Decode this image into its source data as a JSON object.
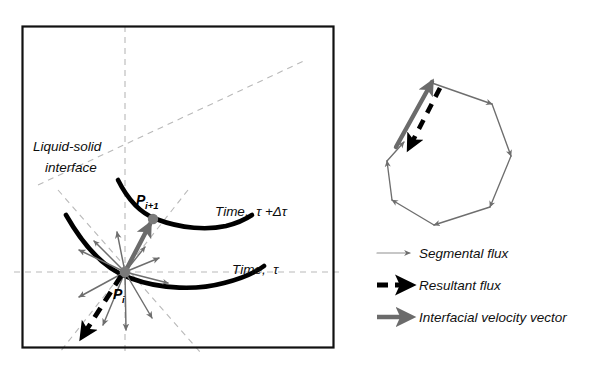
{
  "figure": {
    "kind": "schematic-diagram",
    "background": "#ffffff",
    "panels": [
      "interface-panel",
      "polygon-panel",
      "legend-panel"
    ]
  },
  "colors": {
    "curve": "#000000",
    "box_border": "#111111",
    "guide_dash": "#b9b9b9",
    "segmental_arrow": "#6e6e6e",
    "velocity_arrow": "#6b6b6b",
    "resultant_arrow": "#000000",
    "node_dot": "#7a7a7a",
    "text": "#0d0d0d"
  },
  "left_panel": {
    "name": "liquid-solid-interface-panel",
    "box": {
      "x": 22,
      "y": 26,
      "width": 311,
      "height": 321
    },
    "annotations": {
      "interface_label_line1": "Liquid-solid",
      "interface_label_line2": "interface",
      "time_upper": "Time,  τ +Δτ",
      "time_lower": "Time,  τ",
      "point_i": "P",
      "point_i_sub": "i",
      "point_i_plus_1": "P",
      "point_i_plus_1_sub": "i+1"
    },
    "guides": {
      "vertical_dashed_x": 125,
      "horizontal_dashed_y": 272,
      "diagonal_count": 2
    },
    "nodes": [
      {
        "id": "Pi",
        "x": 125,
        "y": 272
      },
      {
        "id": "Pi+1",
        "x": 153,
        "y": 218
      }
    ],
    "segmental_flux_arrow_count": 10,
    "velocity_vector": {
      "from": "Pi",
      "to": "Pi+1"
    },
    "resultant_flux": {
      "from": "Pi",
      "direction": "down-left"
    }
  },
  "right_panel": {
    "name": "polygon-flux-panel",
    "shape": "heptagon",
    "vertex_count": 7,
    "edge_arrow_count": 7,
    "highlighted_edge": "upper-left",
    "highlighted_edge_overlays": [
      "interfacial-velocity-vector",
      "resultant-flux"
    ]
  },
  "legend": {
    "name": "flux-legend",
    "items": [
      {
        "id": "segmental-flux",
        "label": "Segmental flux",
        "style": "thin-gray-arrow",
        "color": "#6e6e6e"
      },
      {
        "id": "resultant-flux",
        "label": "Resultant flux",
        "style": "thick-black-dashed-arrow",
        "color": "#000000"
      },
      {
        "id": "interfacial-vector",
        "label": "Interfacial velocity vector",
        "style": "thick-gray-arrow",
        "color": "#6b6b6b"
      }
    ]
  }
}
